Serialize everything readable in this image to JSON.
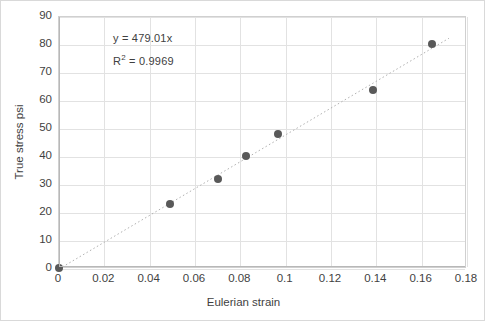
{
  "chart_data": {
    "type": "scatter",
    "title": "",
    "xlabel": "Eulerian strain",
    "ylabel": "True stress psi",
    "xlim": [
      0,
      0.18
    ],
    "ylim": [
      0,
      90
    ],
    "xticks": [
      "0",
      "0.02",
      "0.04",
      "0.06",
      "0.08",
      "0.1",
      "0.12",
      "0.14",
      "0.16",
      "0.18"
    ],
    "xtick_values": [
      0,
      0.02,
      0.04,
      0.06,
      0.08,
      0.1,
      0.12,
      0.14,
      0.16,
      0.18
    ],
    "yticks": [
      "0",
      "10",
      "20",
      "30",
      "40",
      "50",
      "60",
      "70",
      "80",
      "90"
    ],
    "ytick_values": [
      0,
      10,
      20,
      30,
      40,
      50,
      60,
      70,
      80,
      90
    ],
    "grid": true,
    "legend": "none",
    "x": [
      0,
      0.049,
      0.07,
      0.0825,
      0.0965,
      0.1385,
      0.1645
    ],
    "y": [
      0.5,
      23.3,
      32.0,
      40.2,
      48.3,
      64.0,
      80.2
    ],
    "series": [
      {
        "name": "True stress vs Eulerian strain",
        "marker": "circle",
        "marker_color": "#595959",
        "points": [
          {
            "x": 0,
            "y": 0.5
          },
          {
            "x": 0.049,
            "y": 23.3
          },
          {
            "x": 0.07,
            "y": 32.0
          },
          {
            "x": 0.0825,
            "y": 40.2
          },
          {
            "x": 0.0965,
            "y": 48.3
          },
          {
            "x": 0.1385,
            "y": 64.0
          },
          {
            "x": 0.1645,
            "y": 80.2
          }
        ]
      }
    ],
    "trendline": {
      "type": "linear",
      "style": "dotted",
      "color": "#b0b0b0",
      "slope": 479.01,
      "intercept": 0,
      "x_start": 0,
      "x_end": 0.172,
      "equation": "y = 479.01x",
      "r_squared_label": "R² = 0.9969",
      "r_squared": 0.9969
    },
    "annotations": [
      {
        "text": "y = 479.01x"
      },
      {
        "text": "R² = 0.9969"
      }
    ],
    "colors": {
      "marker": "#595959",
      "gridline": "#e2e2e2",
      "axis": "#b8b8b8",
      "trendline": "#b0b0b0",
      "text": "#3f3f3f",
      "background": "#ffffff",
      "border": "#d9d9d9"
    }
  },
  "annotation": {
    "equation": "y = 479.01x",
    "r2_prefix": "R",
    "r2_exponent": "2",
    "r2_suffix": " = 0.9969"
  },
  "axes": {
    "x_title": "Eulerian strain",
    "y_title": "True stress psi"
  }
}
